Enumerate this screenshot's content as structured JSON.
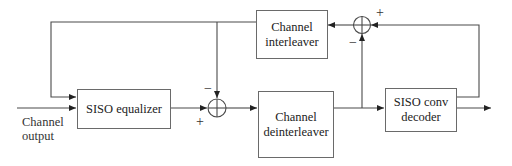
{
  "diagram": {
    "type": "block-diagram",
    "blocks": {
      "siso_equalizer": {
        "label": "SISO equalizer"
      },
      "channel_interleaver": {
        "line1": "Channel",
        "line2": "interleaver"
      },
      "channel_deinterleaver": {
        "line1": "Channel",
        "line2": "deinterleaver"
      },
      "siso_conv_decoder": {
        "line1": "SISO conv",
        "line2": "decoder"
      }
    },
    "input": {
      "line1": "Channel",
      "line2": "output"
    },
    "summers": {
      "left": {
        "plus": "+",
        "minus": "−"
      },
      "top": {
        "plus": "+",
        "minus": "−"
      }
    },
    "colors": {
      "line": "#4a4a4a",
      "box_border": "#6a6a6a",
      "background": "#ffffff"
    }
  }
}
